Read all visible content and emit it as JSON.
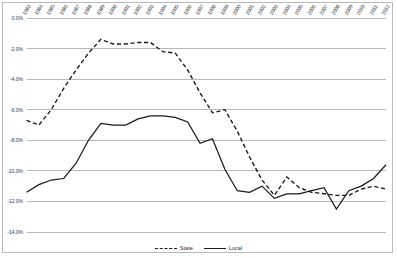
{
  "chart_data": {
    "type": "line",
    "title": "",
    "xlabel": "",
    "ylabel": "",
    "grid": true,
    "legend_position": "bottom",
    "ylim": [
      -14.0,
      0.0
    ],
    "ytick_labels": [
      "0.0%",
      "-2.0%",
      "-4.0%",
      "-6.0%",
      "-8.0%",
      "-10.0%",
      "-12.0%",
      "-14.0%"
    ],
    "ytick_values": [
      0.0,
      -2.0,
      -4.0,
      -6.0,
      -8.0,
      -10.0,
      -12.0,
      -14.0
    ],
    "categories": [
      "1983",
      "1984",
      "1985",
      "1986",
      "1987",
      "1988",
      "1989",
      "1990",
      "1991",
      "1992",
      "1993",
      "1994",
      "1995",
      "1996",
      "1997",
      "1998",
      "1999",
      "2000",
      "2001",
      "2002",
      "2003",
      "2004",
      "2005",
      "2006",
      "2007",
      "2008",
      "2009",
      "2010",
      "2011",
      "2012"
    ],
    "series": [
      {
        "name": "State",
        "style": "dashed",
        "color": "#1a1a1a",
        "values": [
          -6.7,
          -7.0,
          -6.0,
          -4.6,
          -3.4,
          -2.3,
          -1.4,
          -1.7,
          -1.7,
          -1.6,
          -1.6,
          -2.2,
          -2.3,
          -3.4,
          -4.9,
          -6.2,
          -6.0,
          -7.4,
          -9.1,
          -10.6,
          -11.6,
          -10.4,
          -11.1,
          -11.4,
          -11.5,
          -11.6,
          -11.6,
          -11.2,
          -11.0,
          -11.2
        ]
      },
      {
        "name": "Local",
        "style": "solid",
        "color": "#1a1a1a",
        "values": [
          -11.4,
          -10.9,
          -10.6,
          -10.5,
          -9.5,
          -8.0,
          -6.9,
          -7.0,
          -7.0,
          -6.6,
          -6.4,
          -6.4,
          -6.5,
          -6.8,
          -8.2,
          -7.9,
          -9.9,
          -11.3,
          -11.4,
          -11.0,
          -11.8,
          -11.5,
          -11.5,
          -11.3,
          -11.1,
          -12.5,
          -11.3,
          -11.0,
          -10.5,
          -9.6
        ]
      }
    ]
  },
  "legend": {
    "entries": [
      {
        "label": "State",
        "style": "dashed"
      },
      {
        "label": "Local",
        "style": "solid"
      }
    ]
  }
}
